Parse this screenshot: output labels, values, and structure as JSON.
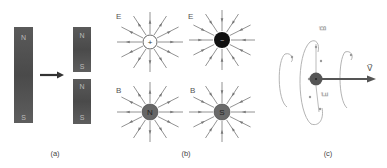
{
  "figure": {
    "panels": [
      {
        "id": "a",
        "caption": "(a)",
        "description": "Breaking a bar magnet produces two smaller magnets",
        "magnet_whole": {
          "top_pole": "N",
          "bottom_pole": "S"
        },
        "magnet_piece_top": {
          "top_pole": "N",
          "bottom_pole": "S"
        },
        "magnet_piece_bottom": {
          "top_pole": "N",
          "bottom_pole": "S"
        },
        "arrow": "right"
      },
      {
        "id": "b",
        "caption": "(b)",
        "description": "Field lines of point charges versus hypothetical magnetic monopoles",
        "charges": [
          {
            "field_label": "E",
            "symbol": "+",
            "kind": "positive charge",
            "fill": "#ffffff"
          },
          {
            "field_label": "E",
            "symbol": "−",
            "kind": "negative charge",
            "fill": "#111111"
          },
          {
            "field_label": "B",
            "symbol": "N",
            "kind": "north monopole",
            "fill": "#666666"
          },
          {
            "field_label": "B",
            "symbol": "S",
            "kind": "south monopole",
            "fill": "#666666"
          }
        ]
      },
      {
        "id": "c",
        "caption": "(c)",
        "description": "Moving charge with velocity v, circulating B and E field loops",
        "labels": {
          "B": "B⃗",
          "E": "E⃗",
          "v": "V⃗"
        }
      }
    ],
    "colors": {
      "magnet": "#595959",
      "arrow": "#333333",
      "field_lines": "#777777",
      "loops": "#aaaaaa",
      "text": "#444444"
    }
  }
}
